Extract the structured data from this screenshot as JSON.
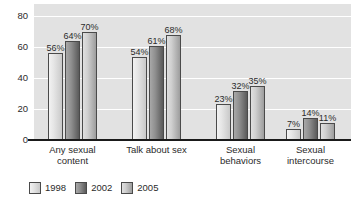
{
  "chart_data": {
    "type": "bar",
    "title": "",
    "subtitle": "",
    "xlabel": "",
    "ylabel": "",
    "ylim": [
      0,
      88
    ],
    "yticks": [
      0,
      20,
      40,
      60,
      80
    ],
    "ytick_labels": [
      "0",
      "20",
      "40",
      "60",
      "80"
    ],
    "grid": true,
    "grid_orientation": "horizontal",
    "legend_position": "bottom-left",
    "value_label_suffix": "%",
    "categories": [
      "Any sexual\ncontent",
      "Talk about sex",
      "Sexual\nbehaviors",
      "Sexual\nintercourse"
    ],
    "series": [
      {
        "name": "1998",
        "color": "#e6e6e6",
        "values": [
          56,
          54,
          23,
          7
        ],
        "labels": [
          "56%",
          "54%",
          "23%",
          "7%"
        ]
      },
      {
        "name": "2002",
        "color": "#8f8f8f",
        "values": [
          64,
          61,
          32,
          14
        ],
        "labels": [
          "64%",
          "61%",
          "32%",
          "14%"
        ]
      },
      {
        "name": "2005",
        "color": "#cfcfcf",
        "values": [
          70,
          68,
          35,
          11
        ],
        "labels": [
          "70%",
          "68%",
          "35%",
          "11%"
        ]
      }
    ]
  },
  "colors": {
    "plot_background": "#e2e2e2",
    "gridline": "#ffffff",
    "axis_line": "#1a1a1a",
    "bar_outline": "#4a4a4a",
    "text": "#2b2b2b",
    "page_background": "#ffffff"
  }
}
